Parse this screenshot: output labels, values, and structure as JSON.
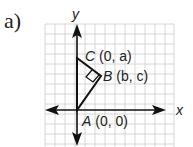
{
  "part_label": "a)",
  "axes": {
    "x_label": "x",
    "y_label": "y"
  },
  "points": [
    {
      "name": "A",
      "coords": "(0, 0)"
    },
    {
      "name": "B",
      "coords": "(b, c)"
    },
    {
      "name": "C",
      "coords": "(0, a)"
    }
  ],
  "right_angle_at": "B",
  "grid": {
    "color": "#c8c8c8",
    "cell_px": 10
  }
}
